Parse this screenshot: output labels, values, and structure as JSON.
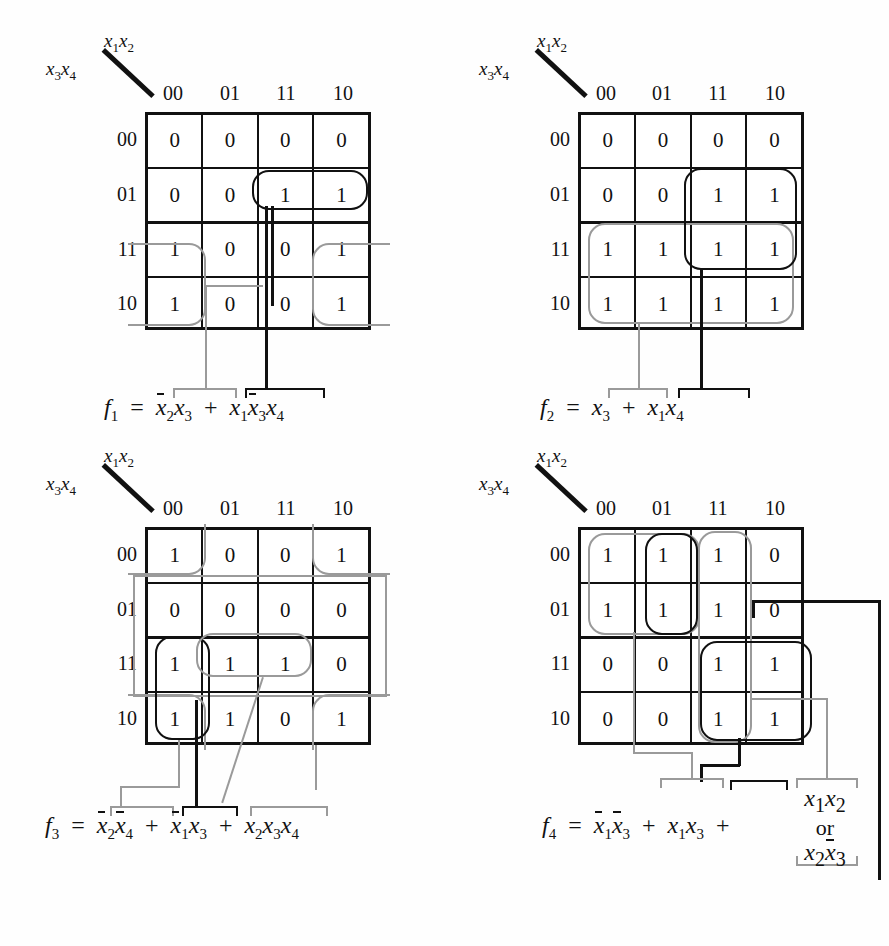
{
  "figure": {
    "kind": "karnaugh-maps",
    "count": 4,
    "axis": {
      "col_var": "x1x2",
      "row_var": "x3x4",
      "col_labels": [
        "00",
        "01",
        "11",
        "10"
      ],
      "row_labels": [
        "00",
        "01",
        "11",
        "10"
      ]
    },
    "colors": {
      "group_primary": "#111111",
      "group_secondary": "#9a9a9a",
      "grid": "#111111"
    }
  },
  "maps": [
    {
      "id": "f1",
      "name_html": "f",
      "name_sub": "1",
      "cells": [
        [
          "0",
          "0",
          "0",
          "0"
        ],
        [
          "0",
          "0",
          "1",
          "1"
        ],
        [
          "1",
          "0",
          "0",
          "1"
        ],
        [
          "1",
          "0",
          "0",
          "1"
        ]
      ],
      "groups": [
        {
          "label": "x1 x3bar x4",
          "color": "#111111",
          "cells": "row 01, cols 11+10"
        },
        {
          "label": "x2bar x3",
          "color": "#9a9a9a",
          "cells": "rows 11+10, cols 00 and 10 (wrap)"
        }
      ],
      "equation": {
        "lhs": "f",
        "lhs_sub": "1",
        "eq": "=",
        "terms": [
          {
            "text": "x2bar x3",
            "color": "#9a9a9a"
          },
          {
            "text": "x1 x3bar x4",
            "color": "#111111"
          }
        ],
        "plain": "f1 = x̄2x3 + x1x̄3x4"
      }
    },
    {
      "id": "f2",
      "name_html": "f",
      "name_sub": "2",
      "cells": [
        [
          "0",
          "0",
          "0",
          "0"
        ],
        [
          "0",
          "0",
          "1",
          "1"
        ],
        [
          "1",
          "1",
          "1",
          "1"
        ],
        [
          "1",
          "1",
          "1",
          "1"
        ]
      ],
      "groups": [
        {
          "label": "x1 x4",
          "color": "#111111",
          "cells": "rows 01+11, cols 11+10"
        },
        {
          "label": "x3",
          "color": "#9a9a9a",
          "cells": "rows 11+10, all cols"
        }
      ],
      "equation": {
        "lhs": "f",
        "lhs_sub": "2",
        "eq": "=",
        "terms": [
          {
            "text": "x3",
            "color": "#9a9a9a"
          },
          {
            "text": "x1 x4",
            "color": "#111111"
          }
        ],
        "plain": "f2 = x3 + x1x4"
      }
    },
    {
      "id": "f3",
      "name_html": "f",
      "name_sub": "3",
      "cells": [
        [
          "1",
          "0",
          "0",
          "1"
        ],
        [
          "0",
          "0",
          "0",
          "0"
        ],
        [
          "1",
          "1",
          "1",
          "0"
        ],
        [
          "1",
          "1",
          "0",
          "1"
        ]
      ],
      "groups": [
        {
          "label": "x2bar x4bar",
          "color": "#9a9a9a",
          "cells": "rows 00+10, cols 00 and 10 (corners, wrap both ways)"
        },
        {
          "label": "x1bar x3",
          "color": "#111111",
          "cells": "rows 11+10, cols 00 (wrap col)"
        },
        {
          "label": "x2 x3 x4",
          "color": "#9a9a9a",
          "cells": "row 11, cols 01+11"
        }
      ],
      "equation": {
        "lhs": "f",
        "lhs_sub": "3",
        "eq": "=",
        "terms": [
          {
            "text": "x2bar x4bar",
            "color": "#9a9a9a"
          },
          {
            "text": "x1bar x3",
            "color": "#111111"
          },
          {
            "text": "x2 x3 x4",
            "color": "#9a9a9a"
          }
        ],
        "plain": "f3 = x̄2x̄4 + x̄1x3 + x2x3x4"
      }
    },
    {
      "id": "f4",
      "name_html": "f",
      "name_sub": "4",
      "cells": [
        [
          "1",
          "1",
          "1",
          "0"
        ],
        [
          "1",
          "1",
          "1",
          "0"
        ],
        [
          "0",
          "0",
          "1",
          "1"
        ],
        [
          "0",
          "0",
          "1",
          "1"
        ]
      ],
      "groups": [
        {
          "label": "x1bar x3bar",
          "color": "#9a9a9a",
          "cells": "rows 00+01, cols 00+01"
        },
        {
          "label": "x1 x3",
          "color": "#111111",
          "cells": "rows 11+10, cols 11+10"
        },
        {
          "label": "x1 x2 (or x2 x3bar)",
          "color": "#111111",
          "cells": "rows 00+01, col 01 / col 11 wrap"
        },
        {
          "label": "x2 x3bar",
          "color": "#9a9a9a",
          "cells": "col 11, all rows"
        }
      ],
      "equation": {
        "lhs": "f",
        "lhs_sub": "4",
        "eq": "=",
        "terms": [
          {
            "text": "x1bar x3bar",
            "color": "#9a9a9a"
          },
          {
            "text": "x1 x3",
            "color": "#111111"
          },
          {
            "text": "x1 x2 or x2 x3bar",
            "color": "#111111"
          }
        ],
        "plain": "f4 = x̄1x̄3 + x1x3 + x1x2 or x2x̄3",
        "alt_word": "or",
        "alt_top": "x1x2",
        "alt_bottom": "x2x3bar"
      }
    }
  ],
  "labels": {
    "col_var_display": "x1x2",
    "row_var_display": "x3x4",
    "or_text": "or"
  }
}
